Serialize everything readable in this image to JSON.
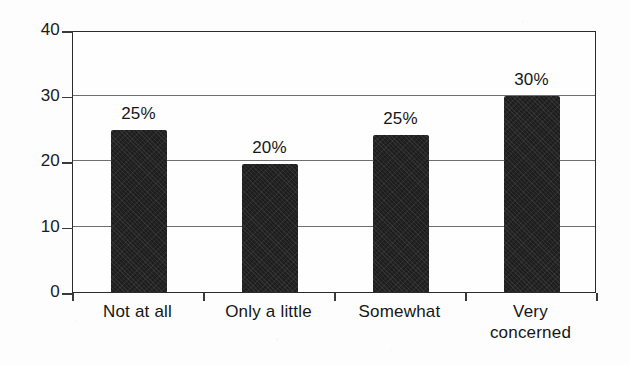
{
  "chart_data": {
    "type": "bar",
    "title": "",
    "subtitle": "",
    "xlabel": "",
    "ylabel": "",
    "categories": [
      "Not at all",
      "Only a little",
      "Somewhat",
      "Very concerned"
    ],
    "category_lines": [
      [
        "Not at all"
      ],
      [
        "Only a little"
      ],
      [
        "Somewhat"
      ],
      [
        "Very",
        "concerned"
      ]
    ],
    "values": [
      24.7,
      19.6,
      23.9,
      30.0
    ],
    "data_labels": [
      "25%",
      "20%",
      "25%",
      "30%"
    ],
    "ylim": [
      0,
      40
    ],
    "ytick_labels": [
      "0",
      "10",
      "20",
      "30",
      "40"
    ],
    "ytick_values": [
      0,
      10,
      20,
      30,
      40
    ],
    "grid": true,
    "grid_axis": "y",
    "legend": false,
    "legend_position": "none",
    "bar_color": "#1e1e1e",
    "grid_color": "#6f6f6f",
    "axis_color": "#2b2b2b",
    "background_color": "#fdfdfd",
    "text_color": "#161616"
  }
}
